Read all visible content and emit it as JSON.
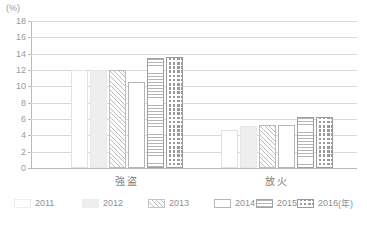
{
  "chart_data": {
    "type": "bar",
    "title": "",
    "unit_label": "(%)",
    "xlabel": "",
    "ylabel": "",
    "ylim": [
      0,
      18
    ],
    "ytick_step": 2,
    "yticks": [
      "18",
      "16",
      "14",
      "12",
      "10",
      "8",
      "6",
      "4",
      "2",
      "0"
    ],
    "grid": true,
    "legend_position": "bottom",
    "legend_unit": "(年)",
    "categories": [
      "強盗",
      "放火"
    ],
    "series": [
      {
        "name": "2011",
        "pattern": "blank",
        "values": [
          12.0,
          4.7
        ]
      },
      {
        "name": "2012",
        "pattern": "solid",
        "values": [
          12.0,
          5.2
        ]
      },
      {
        "name": "2013",
        "pattern": "diag",
        "values": [
          12.0,
          5.3
        ]
      },
      {
        "name": "2014",
        "pattern": "white",
        "values": [
          10.5,
          5.3
        ]
      },
      {
        "name": "2015",
        "pattern": "horiz",
        "values": [
          13.5,
          6.3
        ]
      },
      {
        "name": "2016",
        "pattern": "dots",
        "values": [
          13.6,
          6.3
        ]
      }
    ]
  },
  "legend": {
    "items": [
      {
        "label": "2011",
        "pattern": "blank"
      },
      {
        "label": "2012",
        "pattern": "solid"
      },
      {
        "label": "2013",
        "pattern": "diag"
      },
      {
        "label": "2014",
        "pattern": "white"
      },
      {
        "label": "2015",
        "pattern": "horiz"
      },
      {
        "label": "2016",
        "pattern": "dots"
      }
    ],
    "unit": "(年)"
  }
}
